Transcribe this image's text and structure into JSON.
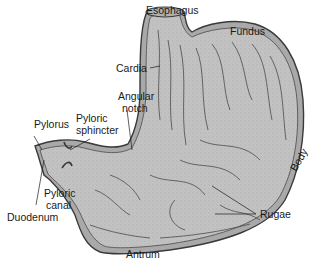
{
  "diagram": {
    "colors": {
      "wall_fill": "#b8b8b8",
      "interior_fill": "#c4c4c4",
      "outline": "#3a3a3a",
      "rugae": "#4a4a4a",
      "text": "#1a1a1a",
      "background": "#ffffff"
    },
    "labels": {
      "esophagus": "Esophagus",
      "fundus": "Fundus",
      "cardia": "Cardia",
      "angular_notch_line1": "Angular",
      "angular_notch_line2": "notch",
      "pylorus": "Pylorus",
      "pyloric_sphincter_line1": "Pyloric",
      "pyloric_sphincter_line2": "sphincter",
      "pyloric_canal_line1": "Pyloric",
      "pyloric_canal_line2": "canal",
      "duodenum": "Duodenum",
      "body": "Body",
      "rugae": "Rugae",
      "antrum": "Antrum"
    }
  }
}
